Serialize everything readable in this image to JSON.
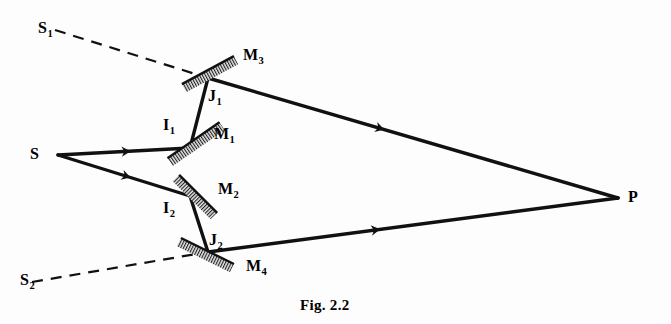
{
  "figure": {
    "caption": "Fig. 2.2",
    "caption_pos": {
      "x": 300,
      "y": 297
    },
    "background": "#fdfdfd",
    "ink_color": "#111111",
    "width": 671,
    "height": 324
  },
  "points": [
    {
      "id": "S",
      "base": "S",
      "sub": "",
      "x": 58,
      "y": 155,
      "label_x": 30,
      "label_y": 146
    },
    {
      "id": "S1",
      "base": "S",
      "sub": "1",
      "x": 55,
      "y": 30,
      "label_x": 38,
      "label_y": 20
    },
    {
      "id": "S2",
      "base": "S",
      "sub": "2",
      "x": 32,
      "y": 282,
      "label_x": 20,
      "label_y": 272
    },
    {
      "id": "I1",
      "base": "I",
      "sub": "1",
      "x": 190,
      "y": 148,
      "label_x": 163,
      "label_y": 117
    },
    {
      "id": "I2",
      "base": "I",
      "sub": "2",
      "x": 190,
      "y": 196,
      "label_x": 163,
      "label_y": 200
    },
    {
      "id": "J1",
      "base": "J",
      "sub": "1",
      "x": 208,
      "y": 78,
      "label_x": 208,
      "label_y": 88
    },
    {
      "id": "J2",
      "base": "J",
      "sub": "2",
      "x": 208,
      "y": 252,
      "label_x": 209,
      "label_y": 232
    },
    {
      "id": "P",
      "base": "P",
      "sub": "",
      "x": 618,
      "y": 198,
      "label_x": 628,
      "label_y": 189
    }
  ],
  "mirrors": [
    {
      "id": "M1",
      "base": "M",
      "sub": "1",
      "x1": 170,
      "y1": 162,
      "x2": 222,
      "y2": 126,
      "label_x": 214,
      "label_y": 126
    },
    {
      "id": "M2",
      "base": "M",
      "sub": "2",
      "x1": 176,
      "y1": 178,
      "x2": 214,
      "y2": 216,
      "label_x": 218,
      "label_y": 181
    },
    {
      "id": "M3",
      "base": "M",
      "sub": "3",
      "x1": 184,
      "y1": 88,
      "x2": 236,
      "y2": 60,
      "label_x": 243,
      "label_y": 47
    },
    {
      "id": "M4",
      "base": "M",
      "sub": "4",
      "x1": 179,
      "y1": 242,
      "x2": 232,
      "y2": 268,
      "label_x": 246,
      "label_y": 258
    }
  ],
  "rays": [
    {
      "id": "ray-S-I1",
      "kind": "solid",
      "from": "S",
      "to": "I1",
      "arrow_t": 0.55
    },
    {
      "id": "ray-S-I2",
      "kind": "solid",
      "from": "S",
      "to": "I2",
      "arrow_t": 0.55
    },
    {
      "id": "ray-I1-J1",
      "kind": "solid",
      "from": "I1",
      "to": "J1",
      "arrow_t": null
    },
    {
      "id": "ray-I2-J2",
      "kind": "solid",
      "from": "I2",
      "to": "J2",
      "arrow_t": null
    },
    {
      "id": "ray-J1-P",
      "kind": "solid",
      "from": "J1",
      "to": "P",
      "arrow_t": 0.43
    },
    {
      "id": "ray-J2-P",
      "kind": "solid",
      "from": "J2",
      "to": "P",
      "arrow_t": 0.42
    },
    {
      "id": "ray-S1-J1",
      "kind": "dashed",
      "from": "S1",
      "to": "J1",
      "arrow_t": null
    },
    {
      "id": "ray-S2-J2",
      "kind": "dashed",
      "from": "S2",
      "to": "J2",
      "arrow_t": null
    }
  ],
  "legend": {
    "description": "Ray diagram of a two-mirror interference arrangement: source S splits into two beams reflecting at I1/I2 on mirrors M1/M2, then at J1/J2 on mirrors M3/M4, converging at point P. Dashed lines trace the virtual images S1 and S2."
  }
}
